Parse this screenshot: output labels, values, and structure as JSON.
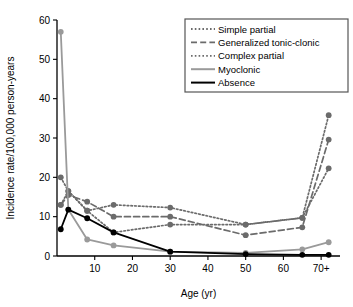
{
  "chart_data": {
    "type": "line",
    "title": "",
    "xlabel": "Age (yr)",
    "ylabel": "Incidence rate/100,000 person-years",
    "xlim": [
      0,
      75
    ],
    "ylim": [
      0,
      60
    ],
    "yticks": [
      0,
      10,
      20,
      30,
      40,
      50,
      60
    ],
    "ytick_labels": [
      "0",
      "10",
      "20",
      "30",
      "40",
      "50",
      "60"
    ],
    "xticks": [
      10,
      20,
      30,
      40,
      50,
      60,
      70
    ],
    "xtick_labels": [
      "10",
      "20",
      "30",
      "40",
      "50",
      "60",
      "70+"
    ],
    "grid": false,
    "legend_position": "top-right",
    "x": [
      1,
      3,
      8,
      15,
      30,
      50,
      65,
      72
    ],
    "series": [
      {
        "name": "Simple partial",
        "style": "dotted",
        "color": "#6b6b6b",
        "marker": "circle",
        "values": [
          20.0,
          16.5,
          11.5,
          13.0,
          12.3,
          8.0,
          9.7,
          35.8
        ]
      },
      {
        "name": "Generalized tonic-clonic",
        "style": "dashed",
        "color": "#6b6b6b",
        "marker": "circle",
        "values": [
          13.0,
          15.5,
          13.8,
          10.0,
          10.0,
          5.3,
          7.3,
          29.6
        ]
      },
      {
        "name": "Complex partial",
        "style": "dotted",
        "color": "#6b6b6b",
        "marker": "circle",
        "values": [
          13.0,
          16.5,
          11.5,
          6.0,
          8.0,
          8.0,
          9.7,
          22.3
        ]
      },
      {
        "name": "Myoclonic",
        "style": "solid",
        "color": "#9a9a9a",
        "marker": "circle",
        "values": [
          57.0,
          11.8,
          4.2,
          2.7,
          1.1,
          0.8,
          1.7,
          3.5
        ]
      },
      {
        "name": "Absence",
        "style": "solid",
        "color": "#000000",
        "marker": "circle",
        "values": [
          6.8,
          11.8,
          9.6,
          6.0,
          1.1,
          0.5,
          0.3,
          0.3
        ]
      }
    ]
  },
  "legend": {
    "items": [
      {
        "label": "Simple partial"
      },
      {
        "label": "Generalized tonic-clonic"
      },
      {
        "label": "Complex partial"
      },
      {
        "label": "Myoclonic"
      },
      {
        "label": "Absence"
      }
    ]
  }
}
